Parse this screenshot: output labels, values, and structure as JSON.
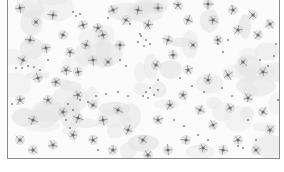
{
  "image": {
    "description": "Micrograph of scattered star-shaped cells and small dots on a light mottled background",
    "frame_color": "#8a8a8a",
    "background_color": "#fbfbfb",
    "mottle_color": "#e6e6e6",
    "cell_color": "#6e6e6e",
    "dot_color": "#4a4a4a",
    "cells": [
      [
        12,
        8
      ],
      [
        28,
        22
      ],
      [
        45,
        15
      ],
      [
        55,
        35
      ],
      [
        75,
        25
      ],
      [
        90,
        28
      ],
      [
        78,
        45
      ],
      [
        95,
        35
      ],
      [
        62,
        52
      ],
      [
        38,
        48
      ],
      [
        22,
        40
      ],
      [
        58,
        70
      ],
      [
        30,
        78
      ],
      [
        48,
        82
      ],
      [
        70,
        72
      ],
      [
        85,
        60
      ],
      [
        100,
        62
      ],
      [
        112,
        45
      ],
      [
        118,
        20
      ],
      [
        130,
        10
      ],
      [
        150,
        8
      ],
      [
        170,
        5
      ],
      [
        200,
        4
      ],
      [
        225,
        10
      ],
      [
        245,
        15
      ],
      [
        262,
        24
      ],
      [
        250,
        35
      ],
      [
        230,
        30
      ],
      [
        210,
        40
      ],
      [
        185,
        45
      ],
      [
        165,
        55
      ],
      [
        148,
        65
      ],
      [
        160,
        40
      ],
      [
        205,
        20
      ],
      [
        180,
        20
      ],
      [
        140,
        25
      ],
      [
        105,
        10
      ],
      [
        15,
        60
      ],
      [
        12,
        100
      ],
      [
        25,
        120
      ],
      [
        40,
        100
      ],
      [
        55,
        112
      ],
      [
        70,
        95
      ],
      [
        85,
        105
      ],
      [
        95,
        120
      ],
      [
        110,
        110
      ],
      [
        120,
        130
      ],
      [
        135,
        140
      ],
      [
        150,
        120
      ],
      [
        162,
        105
      ],
      [
        175,
        95
      ],
      [
        192,
        110
      ],
      [
        205,
        125
      ],
      [
        222,
        108
      ],
      [
        240,
        98
      ],
      [
        255,
        112
      ],
      [
        262,
        130
      ],
      [
        248,
        150
      ],
      [
        230,
        140
      ],
      [
        215,
        150
      ],
      [
        195,
        148
      ],
      [
        178,
        140
      ],
      [
        160,
        150
      ],
      [
        140,
        155
      ],
      [
        105,
        150
      ],
      [
        85,
        140
      ],
      [
        65,
        135
      ],
      [
        45,
        145
      ],
      [
        25,
        150
      ],
      [
        12,
        140
      ],
      [
        70,
        118
      ],
      [
        255,
        72
      ],
      [
        235,
        62
      ],
      [
        220,
        75
      ],
      [
        200,
        80
      ],
      [
        180,
        70
      ]
    ],
    "dots": [
      [
        65,
        12
      ],
      [
        68,
        16
      ],
      [
        72,
        14
      ],
      [
        100,
        18
      ],
      [
        122,
        24
      ],
      [
        133,
        36
      ],
      [
        138,
        40
      ],
      [
        142,
        44
      ],
      [
        136,
        46
      ],
      [
        130,
        42
      ],
      [
        132,
        34
      ],
      [
        8,
        68
      ],
      [
        14,
        68
      ],
      [
        20,
        66
      ],
      [
        26,
        67
      ],
      [
        32,
        70
      ],
      [
        138,
        92
      ],
      [
        142,
        88
      ],
      [
        146,
        95
      ],
      [
        140,
        98
      ],
      [
        135,
        96
      ],
      [
        150,
        90
      ],
      [
        60,
        104
      ],
      [
        65,
        110
      ],
      [
        58,
        120
      ],
      [
        62,
        128
      ],
      [
        72,
        100
      ],
      [
        80,
        102
      ],
      [
        88,
        96
      ],
      [
        98,
        94
      ],
      [
        110,
        92
      ],
      [
        120,
        96
      ],
      [
        230,
        146
      ],
      [
        235,
        148
      ],
      [
        248,
        140
      ],
      [
        210,
        44
      ],
      [
        215,
        52
      ],
      [
        220,
        40
      ],
      [
        252,
        60
      ],
      [
        260,
        66
      ],
      [
        266,
        56
      ],
      [
        190,
        135
      ],
      [
        200,
        140
      ],
      [
        255,
        160
      ],
      [
        112,
        60
      ],
      [
        118,
        66
      ],
      [
        172,
        78
      ],
      [
        184,
        86
      ],
      [
        196,
        92
      ],
      [
        214,
        88
      ],
      [
        224,
        96
      ],
      [
        166,
        120
      ],
      [
        176,
        126
      ],
      [
        240,
        120
      ],
      [
        270,
        100
      ],
      [
        268,
        44
      ],
      [
        150,
        80
      ],
      [
        4,
        104
      ],
      [
        40,
        60
      ],
      [
        90,
        150
      ]
    ]
  }
}
